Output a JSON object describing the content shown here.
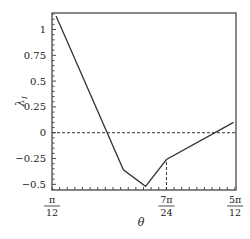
{
  "chart_data": {
    "type": "line",
    "title": "",
    "xlabel": "θ",
    "ylabel": "λ",
    "ylabel_subscript": "I",
    "xlim": [
      0.2618,
      1.3141
    ],
    "ylim": [
      -0.555,
      1.16
    ],
    "grid": false,
    "legend": "none",
    "x_ticks": [
      {
        "value": 0.2618,
        "num": "π",
        "den": "12"
      },
      {
        "value": 0.9163,
        "num": "7π",
        "den": "24"
      },
      {
        "value": 1.309,
        "num": "5π",
        "den": "12"
      }
    ],
    "x_minor_tick_step": 0.0436,
    "y_ticks": [
      {
        "value": 1,
        "label": "1"
      },
      {
        "value": 0.75,
        "label": "0.75"
      },
      {
        "value": 0.5,
        "label": "0.5"
      },
      {
        "value": 0.25,
        "label": "0.25"
      },
      {
        "value": 0,
        "label": "0"
      },
      {
        "value": -0.25,
        "label": "−0.25"
      },
      {
        "value": -0.5,
        "label": "−0.5"
      }
    ],
    "y_minor_tick_step": 0.05,
    "series": [
      {
        "name": "lambda_I",
        "color": "#333333",
        "x": [
          0.285,
          0.67,
          0.797,
          0.9163,
          1.3
        ],
        "y": [
          1.13,
          -0.36,
          -0.52,
          -0.26,
          0.1
        ]
      }
    ],
    "reference_lines": [
      {
        "type": "horizontal",
        "y": 0,
        "style": "dashed"
      },
      {
        "type": "vertical",
        "x": 0.9163,
        "from_y": -0.555,
        "to_y": -0.26,
        "style": "dashed"
      }
    ]
  }
}
